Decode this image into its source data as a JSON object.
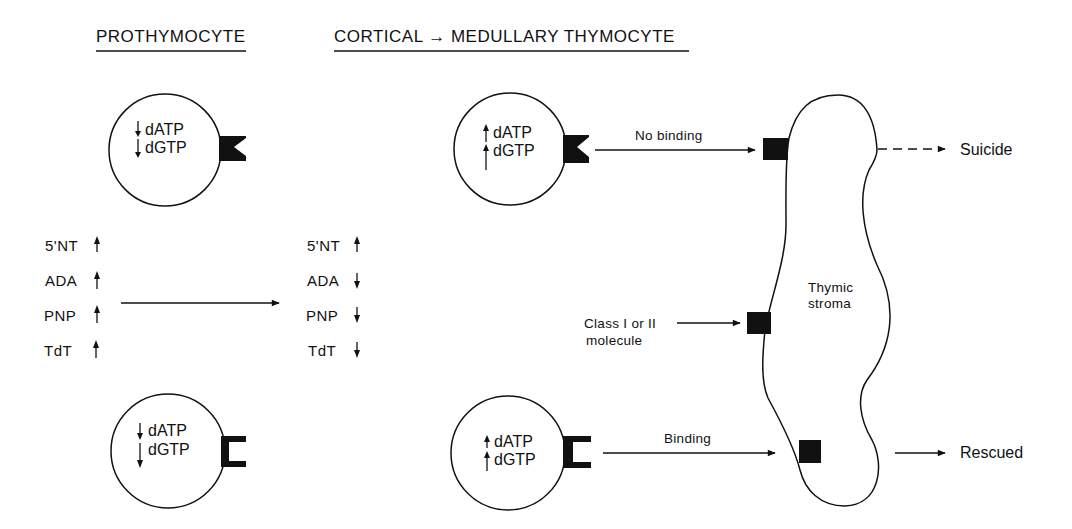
{
  "headings": {
    "left": "PROTHYMOCYTE",
    "right": "CORTICAL → MEDULLARY THYMOCYTE"
  },
  "cells": [
    {
      "id": "prothymocyte-top",
      "receptor": "notched",
      "lines": [
        {
          "label": "dATP",
          "arrow": "down"
        },
        {
          "label": "dGTP",
          "arrow": "down"
        }
      ]
    },
    {
      "id": "prothymocyte-bottom",
      "receptor": "bracket",
      "lines": [
        {
          "label": "dATP",
          "arrow": "down"
        },
        {
          "label": "dGTP",
          "arrow": "down"
        }
      ]
    },
    {
      "id": "thymocyte-top",
      "receptor": "notched",
      "lines": [
        {
          "label": "dATP",
          "arrow": "up"
        },
        {
          "label": "dGTP",
          "arrow": "up"
        }
      ]
    },
    {
      "id": "thymocyte-bottom",
      "receptor": "bracket",
      "lines": [
        {
          "label": "dATP",
          "arrow": "up"
        },
        {
          "label": "dGTP",
          "arrow": "up"
        }
      ]
    }
  ],
  "enzymes": {
    "before": [
      {
        "label": "5'NT",
        "arrow": "up"
      },
      {
        "label": "ADA",
        "arrow": "up"
      },
      {
        "label": "PNP",
        "arrow": "up"
      },
      {
        "label": "TdT",
        "arrow": "up"
      }
    ],
    "after": [
      {
        "label": "5'NT",
        "arrow": "up"
      },
      {
        "label": "ADA",
        "arrow": "down"
      },
      {
        "label": "PNP",
        "arrow": "down"
      },
      {
        "label": "TdT",
        "arrow": "down"
      }
    ]
  },
  "stroma": {
    "label_line1": "Thymic",
    "label_line2": "stroma"
  },
  "annotations": {
    "no_binding": "No binding",
    "binding": "Binding",
    "class_line1": "Class I or II",
    "class_line2": "molecule"
  },
  "outcomes": {
    "suicide": "Suicide",
    "rescued": "Rescued"
  }
}
